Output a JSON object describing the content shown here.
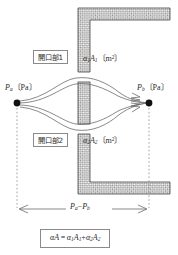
{
  "diagram": {
    "colors": {
      "wall_fill": "#a9a9a9",
      "wall_stroke": "#5a5a5a",
      "line": "#6b6b6b",
      "node": "#111111",
      "text": "#2b2b2b",
      "box_border": "#8a8a8a",
      "background": "#ffffff"
    },
    "labels": {
      "opening1_box": "開口部1",
      "opening2_box": "開口部2",
      "opening1_area": "α₁A₁〔m²〕",
      "opening2_area": "α₂A₂〔m²〕",
      "pressure_left": "Pa〔Pa〕",
      "pressure_right": "Pb〔Pa〕",
      "dimension": "Pa−Pb",
      "equation": "αA = α₁A₁+α₂A₂"
    },
    "math_parts": {
      "alpha1": "α",
      "alpha2": "α",
      "A_symbol": "A",
      "unit_m2": "〔m²〕",
      "unit_pa": "〔Pa〕",
      "P_symbol": "P",
      "sub_1": "1",
      "sub_2": "2",
      "sub_a": "a",
      "sub_b": "b",
      "minus": "−",
      "plus": "+",
      "equals": "="
    },
    "nodes": [
      {
        "name": "node-pressure-a",
        "x": 17,
        "y": 103
      },
      {
        "name": "node-pressure-b",
        "x": 149,
        "y": 103
      }
    ]
  }
}
